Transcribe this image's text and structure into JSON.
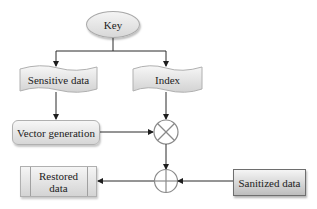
{
  "diagram": {
    "nodes": {
      "key": {
        "label": "Key",
        "shape": "ellipse"
      },
      "sensitive_data": {
        "label": "Sensitive data",
        "shape": "document"
      },
      "index": {
        "label": "Index",
        "shape": "document"
      },
      "vector_generation": {
        "label": "Vector generation",
        "shape": "rounded-rectangle"
      },
      "multiply": {
        "label": "",
        "shape": "circle-x",
        "symbol": "⊗"
      },
      "add": {
        "label": "",
        "shape": "circle-plus",
        "symbol": "⊕"
      },
      "sanitized_data": {
        "label": "Sanitized data",
        "shape": "rectangle"
      },
      "restored_data": {
        "label": "Restored data",
        "label_lines": [
          "Restored",
          "data"
        ],
        "shape": "predefined-process"
      }
    },
    "edges": [
      {
        "from": "key",
        "to": "sensitive_data"
      },
      {
        "from": "key",
        "to": "index"
      },
      {
        "from": "sensitive_data",
        "to": "vector_generation"
      },
      {
        "from": "vector_generation",
        "to": "multiply"
      },
      {
        "from": "index",
        "to": "multiply"
      },
      {
        "from": "multiply",
        "to": "add"
      },
      {
        "from": "sanitized_data",
        "to": "add"
      },
      {
        "from": "add",
        "to": "restored_data"
      }
    ],
    "colors": {
      "line": "#2a2a2a",
      "node_fill_top": "#f5f5f5",
      "node_fill_bottom": "#d4d4d4",
      "operator_stroke": "#8a8a8a"
    }
  }
}
